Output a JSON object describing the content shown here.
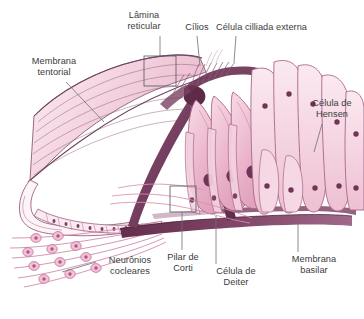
{
  "figure": {
    "language": "pt-BR",
    "background_color": "#ffffff",
    "text_color": "#3b3b3d",
    "leader_line_color": "#6e6e73",
    "callout_box_color": "#5c5c66",
    "palette": {
      "cell_fill_light": "#f7dde6",
      "cell_fill_mid": "#efc3d3",
      "cell_outline": "#9c5f7e",
      "nucleus": "#6f3557",
      "membrane_dark": "#6b3352",
      "tectorial_fill": "#f6dae5",
      "tectorial_stripe": "#7c4a68",
      "neuron_pink": "#d98fb0",
      "basilar_band": "#7a3f5f"
    }
  },
  "labels": [
    {
      "id": "lamina-reticular",
      "text": "Lâmina\nreticular",
      "x": 112,
      "y": 10,
      "width": 64
    },
    {
      "id": "cilios",
      "text": "Cílios",
      "x": 180,
      "y": 22,
      "width": 34
    },
    {
      "id": "celula-cilliada-externa",
      "text": "Célula cilliada externa",
      "x": 216,
      "y": 22,
      "width": 120
    },
    {
      "id": "membrana-tentorial",
      "text": "Membrana\ntentorial",
      "x": 20,
      "y": 56,
      "width": 68
    },
    {
      "id": "celula-de-hensen",
      "text": "Célula de\nHensen",
      "x": 304,
      "y": 98,
      "width": 58
    },
    {
      "id": "neuronios-cocleares",
      "text": "Neurônios\ncocleares",
      "x": 98,
      "y": 255,
      "width": 62
    },
    {
      "id": "pilar-de-corti",
      "text": "Pilar de\nCorti",
      "x": 160,
      "y": 252,
      "width": 48
    },
    {
      "id": "celula-de-deiter",
      "text": "Célula de\nDeiter",
      "x": 209,
      "y": 266,
      "width": 58
    },
    {
      "id": "membrana-basilar",
      "text": "Membrana\nbasilar",
      "x": 285,
      "y": 254,
      "width": 62
    }
  ],
  "structures": [
    {
      "id": "tectorial-membrane",
      "name": "Membrana tentorial"
    },
    {
      "id": "reticular-lamina",
      "name": "Lâmina reticular"
    },
    {
      "id": "stereocilia",
      "name": "Cílios"
    },
    {
      "id": "outer-hair-cells",
      "name": "Célula cilliada externa",
      "count": 3
    },
    {
      "id": "hensen-cells",
      "name": "Célula de Hensen"
    },
    {
      "id": "deiters-cells",
      "name": "Célula de Deiter"
    },
    {
      "id": "pillar-of-corti",
      "name": "Pilar de Corti"
    },
    {
      "id": "basilar-membrane",
      "name": "Membrana basilar"
    },
    {
      "id": "cochlear-neurons",
      "name": "Neurônios cocleares"
    },
    {
      "id": "tunnel-of-corti",
      "name": "Túnel de Corti"
    }
  ],
  "callout_boxes": [
    {
      "id": "reticular-lamina-box",
      "x": 144,
      "y": 56,
      "width": 32,
      "height": 30
    },
    {
      "id": "pillar-base-box",
      "x": 170,
      "y": 186,
      "width": 26,
      "height": 26
    }
  ]
}
